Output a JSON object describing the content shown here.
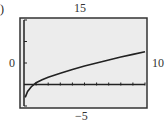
{
  "panel_label": ")",
  "window": {
    "top_label": "15",
    "bottom_label": "−5",
    "left_label": "0",
    "right_label": "10"
  },
  "chart_data": {
    "type": "line",
    "title": "",
    "xlabel": "",
    "ylabel": "",
    "xlim": [
      0,
      10
    ],
    "ylim": [
      -5,
      15
    ],
    "grid": false,
    "x_ticks_every": 1,
    "y_ticks_every": 5,
    "series": [
      {
        "name": "curve",
        "x": [
          0.1,
          0.3,
          0.6,
          1,
          1.5,
          2,
          3,
          4,
          5,
          6,
          7,
          8,
          9,
          10
        ],
        "y": [
          -3.0,
          -1.6,
          -0.5,
          0.4,
          1.1,
          1.7,
          2.6,
          3.5,
          4.3,
          5.0,
          5.7,
          6.4,
          7.0,
          7.6
        ]
      }
    ],
    "colors": {
      "frame_bg": "#ececec",
      "line": "#222222"
    }
  }
}
